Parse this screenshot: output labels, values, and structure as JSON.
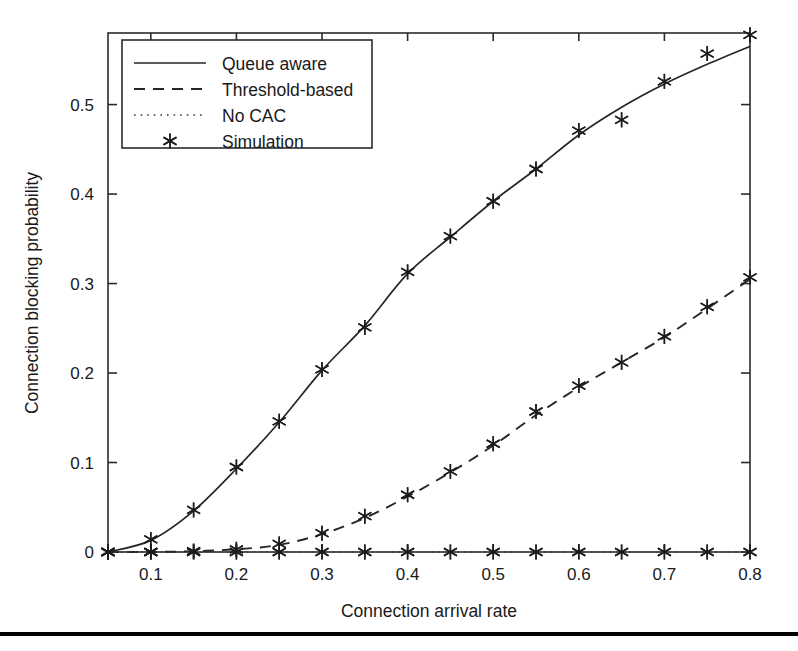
{
  "figure": {
    "background": "#ffffff",
    "ink_color": "#262626",
    "footer_rule": true
  },
  "chart_data": {
    "type": "line",
    "title": "",
    "subtitle": "",
    "xlabel": "Connection arrival rate",
    "ylabel": "Connection blocking probability",
    "xlim": [
      0.05,
      0.8
    ],
    "ylim": [
      0,
      0.58
    ],
    "grid": false,
    "legend_position": "upper left",
    "x_ticks": [
      0.1,
      0.2,
      0.3,
      0.4,
      0.5,
      0.6,
      0.7,
      0.8
    ],
    "x_tick_labels": [
      "0.1",
      "0.2",
      "0.3",
      "0.4",
      "0.5",
      "0.6",
      "0.7",
      "0.8"
    ],
    "y_ticks": [
      0,
      0.1,
      0.2,
      0.3,
      0.4,
      0.5
    ],
    "y_tick_labels": [
      "0",
      "0.1",
      "0.2",
      "0.3",
      "0.4",
      "0.5"
    ],
    "x": [
      0.05,
      0.1,
      0.15,
      0.2,
      0.25,
      0.3,
      0.35,
      0.4,
      0.45,
      0.5,
      0.55,
      0.6,
      0.65,
      0.7,
      0.75,
      0.8
    ],
    "series": [
      {
        "name": "Queue aware",
        "style": "solid",
        "values": [
          0.0,
          0.013,
          0.046,
          0.093,
          0.145,
          0.203,
          0.253,
          0.311,
          0.352,
          0.392,
          0.428,
          0.466,
          0.497,
          0.523,
          0.545,
          0.565
        ]
      },
      {
        "name": "Threshold-based",
        "style": "dashed",
        "values": [
          0.0,
          0.0,
          0.001,
          0.003,
          0.008,
          0.02,
          0.038,
          0.062,
          0.089,
          0.119,
          0.153,
          0.184,
          0.212,
          0.24,
          0.272,
          0.305
        ]
      },
      {
        "name": "No CAC",
        "style": "dotted",
        "values": [
          0.0,
          0.0,
          0.0,
          0.0,
          0.0,
          0.0,
          0.0,
          0.0,
          0.0,
          0.0,
          0.0,
          0.0,
          0.0,
          0.0,
          0.0,
          0.0
        ]
      },
      {
        "name": "Simulation",
        "style": "marker",
        "marker": "asterisk",
        "values": [
          0.0,
          0.014,
          0.047,
          0.095,
          0.146,
          0.204,
          0.251,
          0.313,
          0.353,
          0.392,
          0.428,
          0.471,
          0.483,
          0.526,
          0.557,
          0.578
        ]
      },
      {
        "name": "Simulation Threshold-based",
        "style": "marker",
        "marker": "asterisk",
        "values": [
          0.0,
          0.0,
          0.001,
          0.003,
          0.009,
          0.021,
          0.04,
          0.064,
          0.09,
          0.121,
          0.157,
          0.186,
          0.212,
          0.241,
          0.274,
          0.307
        ]
      },
      {
        "name": "Simulation No CAC",
        "style": "marker",
        "marker": "asterisk",
        "values": [
          0.0,
          0.0,
          0.0,
          0.0,
          0.0,
          0.0,
          0.0,
          0.0,
          0.0,
          0.0,
          0.0,
          0.0,
          0.0,
          0.0,
          0.0,
          0.0
        ]
      }
    ],
    "legend": [
      {
        "label": "Queue aware",
        "style": "solid"
      },
      {
        "label": "Threshold-based",
        "style": "dashed"
      },
      {
        "label": "No CAC",
        "style": "dotted"
      },
      {
        "label": "Simulation",
        "style": "marker"
      }
    ]
  }
}
